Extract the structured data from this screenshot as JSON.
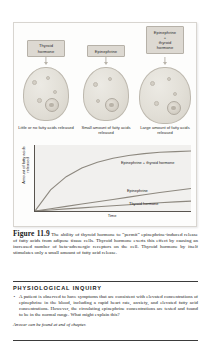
{
  "figure": {
    "panel": {
      "columns": [
        {
          "hormone_label": "Thyroid\nhormone",
          "hormone_label_line1": "Thyroid",
          "hormone_label_line2": "hormone",
          "caption": "Little or no fatty acids released"
        },
        {
          "hormone_label_line1": "Epinephrine",
          "hormone_label_line2": "",
          "caption": "Small amount of fatty acids released"
        },
        {
          "hormone_label_line1": "Epinephrine",
          "hormone_label_line2": "+",
          "hormone_label_line3": "thyroid",
          "hormone_label_line4": "hormone",
          "caption": "Large amount of fatty acids released"
        }
      ]
    },
    "caption_number": "Figure 11.9",
    "caption_text": "The ability of thyroid hormone to “permit” epinephrine-induced release of fatty acids from adipose tissue cells. Thyroid hormone exerts this effect by causing an increased number of beta-adrenergic receptors on the cell. Thyroid hormone by itself stimulates only a small amount of fatty acid release."
  },
  "chart_data": {
    "type": "line",
    "title": "",
    "xlabel": "Time",
    "ylabel": "Amount of fatty acids released",
    "xlim": [
      0,
      10
    ],
    "ylim": [
      0,
      10
    ],
    "grid": false,
    "legend": "inline-labels",
    "x": [
      0,
      1,
      2,
      3,
      4,
      5,
      6,
      7,
      8,
      9,
      10
    ],
    "series": [
      {
        "name": "Epinephrine + thyroid hormone",
        "values": [
          0,
          3.2,
          5.2,
          6.5,
          7.4,
          8.0,
          8.4,
          8.7,
          8.9,
          9.0,
          9.1
        ],
        "color": "#8d887f"
      },
      {
        "name": "Epinephrine",
        "values": [
          0,
          0.35,
          0.7,
          1.05,
          1.4,
          1.75,
          2.1,
          2.45,
          2.8,
          3.1,
          3.4
        ],
        "color": "#8d887f"
      },
      {
        "name": "Thyroid hormone",
        "values": [
          0,
          0.16,
          0.32,
          0.48,
          0.64,
          0.8,
          0.95,
          1.1,
          1.25,
          1.38,
          1.5
        ],
        "color": "#8d887f"
      }
    ]
  },
  "inquiry": {
    "title": "PHYSIOLOGICAL INQUIRY",
    "bullet": "•",
    "question": "A patient is observed to have symptoms that are consistent with elevated concentrations of epinephrine in the blood, including a rapid heart rate, anxiety, and elevated fatty acid concentrations. However, the circulating epinephrine concentrations are tested and found to be in the normal range. What might explain this?",
    "answer_note": "Answer can be found at end of chapter."
  },
  "colors": {
    "panel_border": "#d8d5d0",
    "box_fill": "#ddd9d2",
    "plot_bg": "#f1f0ee",
    "axis": "#58544e",
    "curve": "#8d887f"
  }
}
